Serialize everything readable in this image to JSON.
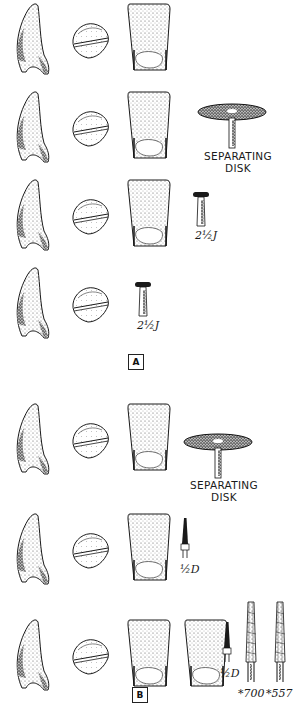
{
  "figure": {
    "panels": [
      {
        "id": "A",
        "label": "A",
        "rows": [
          {
            "step": 1,
            "views": [
              "proximal",
              "incisal",
              "lingual"
            ],
            "instrument": null
          },
          {
            "step": 2,
            "views": [
              "proximal",
              "incisal",
              "lingual"
            ],
            "instrument": {
              "type": "separating-disk",
              "label_line1": "SEPARATING",
              "label_line2": "DISK"
            }
          },
          {
            "step": 3,
            "views": [
              "proximal",
              "incisal",
              "lingual"
            ],
            "instrument": {
              "type": "inverted-cone-bur",
              "label": "2½J"
            }
          },
          {
            "step": 4,
            "views": [
              "proximal",
              "incisal"
            ],
            "instrument": {
              "type": "inverted-cone-bur",
              "label": "2½J"
            }
          }
        ]
      },
      {
        "id": "B",
        "label": "B",
        "rows": [
          {
            "step": 1,
            "views": [
              "proximal",
              "incisal",
              "lingual"
            ],
            "instrument": {
              "type": "separating-disk",
              "label_line1": "SEPARATING",
              "label_line2": "DISK"
            }
          },
          {
            "step": 2,
            "views": [
              "proximal",
              "incisal",
              "lingual"
            ],
            "instrument": {
              "type": "tapered-bur",
              "label": "½D"
            }
          },
          {
            "step": 3,
            "views": [
              "proximal",
              "incisal",
              "lingual",
              "lingual-alt"
            ],
            "instrument": [
              {
                "type": "tapered-bur",
                "label": "½D"
              },
              {
                "type": "crosscut-fissure-bur",
                "label": "*700"
              },
              {
                "type": "crosscut-fissure-bur",
                "label": "*557"
              }
            ]
          }
        ]
      }
    ],
    "labels": {
      "disk_a_1": "SEPARATING",
      "disk_a_2": "DISK",
      "bur_a_row3": "2½J",
      "bur_a_row4": "2½J",
      "panel_a": "A",
      "disk_b_1": "SEPARATING",
      "disk_b_2": "DISK",
      "bur_b_row2": "½D",
      "bur_b_row3_a": "½D",
      "bur_b_row3_b": "*700",
      "bur_b_row3_c": "*557",
      "panel_b": "B"
    },
    "colors": {
      "ink": "#1a1a1a",
      "background": "#ffffff"
    }
  }
}
